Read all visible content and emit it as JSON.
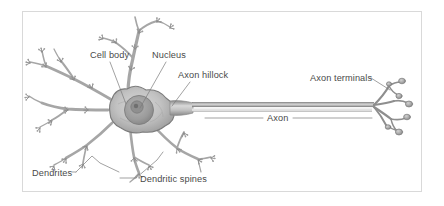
{
  "figure": {
    "kind": "neuron-anatomy-diagram",
    "frame_border_color": "#d9d9d9",
    "background_color": "#ffffff",
    "ink_color": "#6f6f6f",
    "label_color": "#4a4a4a",
    "leader_line_color": "#7a7a7a"
  },
  "labels": {
    "cell_body": "Cell body",
    "nucleus": "Nucleus",
    "axon_hillock": "Axon hillock",
    "axon_terminals": "Axon terminals",
    "axon": "Axon",
    "dendrites": "Dendrites",
    "dendritic_spines": "Dendritic spines"
  }
}
